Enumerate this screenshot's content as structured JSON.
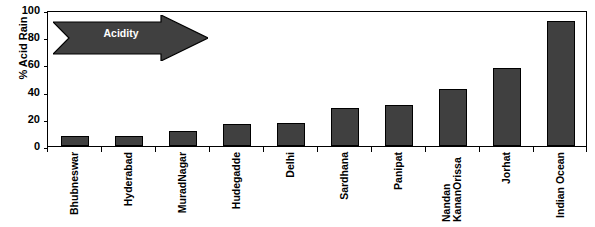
{
  "chart_data": {
    "type": "bar",
    "title": "",
    "xlabel": "",
    "ylabel": "% Acid Rain",
    "ylim": [
      0,
      100
    ],
    "yticks": [
      0,
      20,
      40,
      60,
      80,
      100
    ],
    "grid": false,
    "legend": null,
    "bar_color": "#404040",
    "bar_edge_color": "#000000",
    "categories": [
      "Bhubneswar",
      "Hyderabad",
      "MuradNagar",
      "Hudegadde",
      "Delhi",
      "Sardhana",
      "Panipat",
      "Nandan KananOrissa",
      "Jorhat",
      "Indian Ocean"
    ],
    "values": [
      7,
      7,
      11,
      16,
      17,
      28,
      30,
      42,
      57,
      92
    ],
    "annotations": [
      {
        "text": "Acidity",
        "shape": "right-arrow",
        "direction": "right",
        "fill": "#404040",
        "text_color": "#ffffff"
      }
    ]
  },
  "axes": {
    "y_title": "% Acid Rain",
    "y_ticks": [
      "0",
      "20",
      "40",
      "60",
      "80",
      "100"
    ],
    "x_categories": [
      {
        "label": "Bhubneswar",
        "lines": [
          "Bhubneswar"
        ]
      },
      {
        "label": "Hyderabad",
        "lines": [
          "Hyderabad"
        ]
      },
      {
        "label": "MuradNagar",
        "lines": [
          "MuradNagar"
        ]
      },
      {
        "label": "Hudegadde",
        "lines": [
          "Hudegadde"
        ]
      },
      {
        "label": "Delhi",
        "lines": [
          "Delhi"
        ]
      },
      {
        "label": "Sardhana",
        "lines": [
          "Sardhana"
        ]
      },
      {
        "label": "Panipat",
        "lines": [
          "Panipat"
        ]
      },
      {
        "label": "Nandan KananOrissa",
        "lines": [
          "Nandan",
          "KananOrissa"
        ]
      },
      {
        "label": "Jorhat",
        "lines": [
          "Jorhat"
        ]
      },
      {
        "label": "Indian Ocean",
        "lines": [
          "Indian Ocean"
        ]
      }
    ]
  },
  "annotation": {
    "acidity_label": "Acidity"
  }
}
